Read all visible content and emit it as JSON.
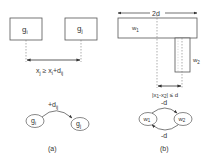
{
  "panel_a": {
    "caption": "(a)",
    "box_left": {
      "label": "g",
      "sub": "i"
    },
    "box_right": {
      "label": "g",
      "sub": "j"
    },
    "constraint": {
      "lhs": "x",
      "lhs_sub": "j",
      "op": " ≥ ",
      "rhs": "x",
      "rhs_sub": "i",
      "plus": "+d",
      "plus_sub": "ij"
    },
    "graph": {
      "node_from": {
        "label": "g",
        "sub": "i"
      },
      "node_to": {
        "label": "g",
        "sub": "j"
      },
      "edge": {
        "label": "+d",
        "sub": "ij"
      }
    }
  },
  "panel_b": {
    "caption": "(b)",
    "width_label": "2d",
    "rect_large": {
      "label": "w",
      "sub": "1"
    },
    "rect_small": {
      "label": "w",
      "sub": "2"
    },
    "constraint": {
      "open": "|x",
      "s1": "1",
      "mid": "-x",
      "s2": "2",
      "close": "| ≤ d"
    },
    "graph": {
      "node_left": {
        "label": "w",
        "sub": "1"
      },
      "node_right": {
        "label": "w",
        "sub": "2"
      },
      "edge_top": {
        "label": "-d"
      },
      "edge_bottom": {
        "label": "-d"
      }
    }
  },
  "colors": {
    "stroke": "#555555",
    "text": "#333333",
    "background": "#ffffff"
  }
}
